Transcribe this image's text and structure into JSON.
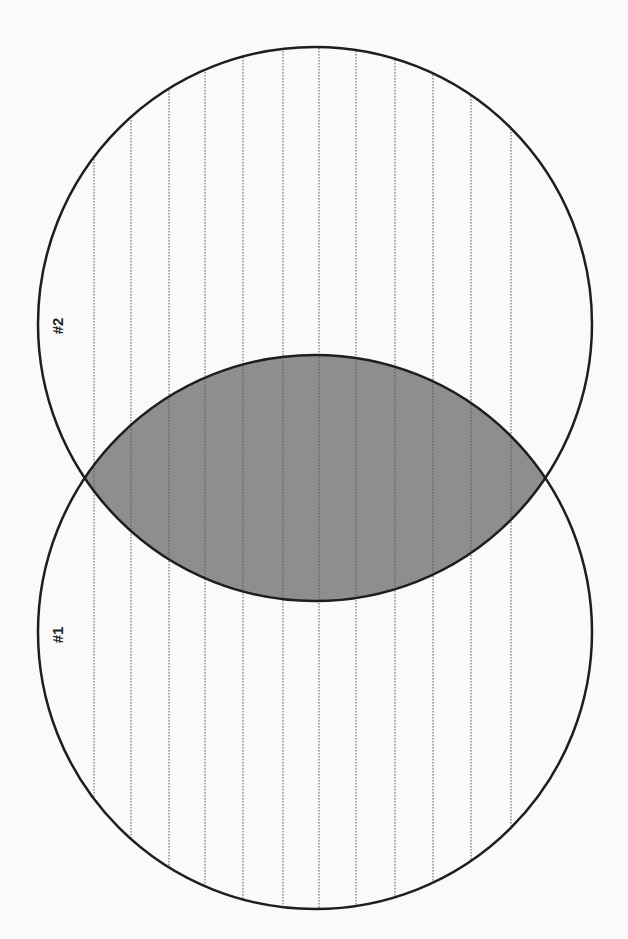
{
  "diagram": {
    "type": "venn",
    "orientation": "rotated-90",
    "sets": [
      {
        "id": "set-1",
        "label": "#1",
        "cx": 315,
        "cy": 632,
        "r": 277
      },
      {
        "id": "set-2",
        "label": "#2",
        "cx": 315,
        "cy": 324,
        "r": 277
      }
    ],
    "intersection": {
      "fill": "#8e8e8e",
      "shaded": true
    },
    "ruled_lines": {
      "style": "dotted",
      "color": "#555555",
      "x_positions": [
        94,
        131,
        169,
        205,
        243,
        283,
        319,
        356,
        395,
        433,
        471,
        511
      ]
    },
    "colors": {
      "background": "#fafafa",
      "outline": "#1e1e1e",
      "intersection_fill": "#8e8e8e"
    }
  }
}
